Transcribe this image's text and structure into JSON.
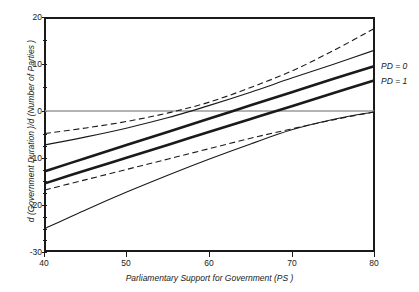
{
  "axes": {
    "x_label": "Parliamentary Support for Government (PS )",
    "y_label": "d (Government Duration )/d (Number of Parties )",
    "x_ticks": [
      "40",
      "50",
      "60",
      "70",
      "80"
    ],
    "y_ticks": [
      "20",
      "10",
      "0",
      "-10",
      "-20",
      "-30"
    ]
  },
  "legend": {
    "pd0": "PD = 0",
    "pd1": "PD = 1"
  },
  "colors": {
    "line": "#1a1a1a",
    "zero_line": "#9a9a9a",
    "frame": "#1a1a1a",
    "background": "#ffffff"
  },
  "chart_data": {
    "type": "line",
    "title": "",
    "xlabel": "Parliamentary Support for Government (PS )",
    "ylabel": "d (Government Duration )/d (Number of Parties )",
    "xlim": [
      40,
      80
    ],
    "ylim": [
      -30,
      20
    ],
    "x_ticks": [
      40,
      50,
      60,
      70,
      80
    ],
    "y_ticks": [
      20,
      10,
      0,
      -10,
      -20,
      -30
    ],
    "grid": false,
    "legend_position": "right-outside",
    "annotations": [
      {
        "text": "PD = 0",
        "x": 80,
        "y": 9.5
      },
      {
        "text": "PD = 1",
        "x": 80,
        "y": 6.5
      }
    ],
    "reference_lines": [
      {
        "orientation": "horizontal",
        "y": 0,
        "style": "solid",
        "color": "#9a9a9a"
      }
    ],
    "x": [
      40,
      45,
      50,
      55,
      60,
      65,
      70,
      75,
      80
    ],
    "series": [
      {
        "name": "PD = 0 upper confidence bound",
        "style": "dashed",
        "width": "thin",
        "values": [
          -4.8,
          -3.6,
          -2.2,
          -0.4,
          1.9,
          5.0,
          8.5,
          12.8,
          17.5
        ]
      },
      {
        "name": "PD = 0 point estimate",
        "style": "solid",
        "width": "thick",
        "values": [
          -12.8,
          -10.0,
          -7.2,
          -4.4,
          -1.6,
          1.2,
          4.0,
          6.8,
          9.5
        ]
      },
      {
        "name": "PD = 0 lower confidence bound",
        "style": "solid",
        "width": "thin",
        "values": [
          -25.0,
          -21.0,
          -17.2,
          -13.6,
          -10.2,
          -7.0,
          -4.0,
          -1.8,
          -0.2
        ]
      },
      {
        "name": "PD = 1 upper confidence bound",
        "style": "solid",
        "width": "thin",
        "values": [
          -7.2,
          -5.5,
          -3.6,
          -1.4,
          1.2,
          4.0,
          7.0,
          9.9,
          12.9
        ]
      },
      {
        "name": "PD = 1 point estimate",
        "style": "solid",
        "width": "thick",
        "values": [
          -15.4,
          -12.6,
          -9.9,
          -7.2,
          -4.4,
          -1.7,
          1.0,
          3.8,
          6.5
        ]
      },
      {
        "name": "PD = 1 lower confidence bound",
        "style": "dashed",
        "width": "thin",
        "values": [
          -16.8,
          -14.6,
          -12.4,
          -10.2,
          -8.0,
          -5.8,
          -3.8,
          -1.9,
          -0.2
        ]
      }
    ]
  }
}
